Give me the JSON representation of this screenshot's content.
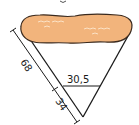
{
  "figure": {
    "type": "cone-cross-section",
    "colors": {
      "fill": "#f2b47c",
      "outline": "#3b2a1e",
      "lines": "#1a1a1a",
      "highlights": "#fbe2c6"
    },
    "labels": {
      "full_slant": "68",
      "lower_slant": "34",
      "inner_width": "30,5"
    }
  }
}
